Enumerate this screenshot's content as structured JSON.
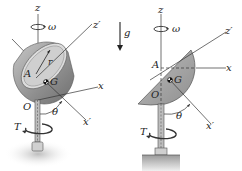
{
  "figure": {
    "colors": {
      "shell_outer": "#8a8a8a",
      "shell_inner": "#d6d6d6",
      "shell_solid": "#a9a9a9",
      "line": "#333333",
      "ground": "#cfcfcf"
    },
    "left_view": {
      "labels": {
        "z": "z",
        "omega": "ω",
        "z_prime": "z′",
        "r": "r",
        "A": "A",
        "G": "G",
        "x": "x",
        "O": "O",
        "theta": "θ",
        "x_prime": "x′",
        "T": "T"
      }
    },
    "gravity": {
      "label": "g"
    },
    "right_view": {
      "labels": {
        "z": "z",
        "omega": "ω",
        "z_prime": "z′",
        "A": "A",
        "G": "G",
        "x": "x",
        "O": "O",
        "theta": "θ",
        "x_prime": "x′",
        "T": "T"
      }
    }
  }
}
